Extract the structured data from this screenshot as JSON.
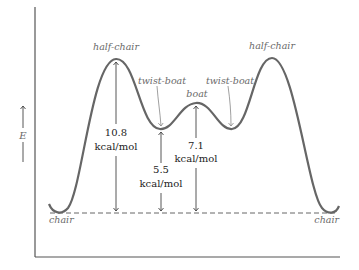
{
  "diagram": {
    "axis": {
      "y_label": "E"
    },
    "labels": {
      "chair_left": "chair",
      "chair_right": "chair",
      "half_chair_left": "half-chair",
      "half_chair_right": "half-chair",
      "twist_boat_left": "twist-boat",
      "twist_boat_right": "twist-boat",
      "boat": "boat"
    },
    "energies": [
      {
        "id": "half_chair",
        "value": "10.8",
        "unit": "kcal/mol"
      },
      {
        "id": "twist_boat",
        "value": "5.5",
        "unit": "kcal/mol"
      },
      {
        "id": "boat",
        "value": "7.1",
        "unit": "kcal/mol"
      }
    ],
    "colors": {
      "curve": "#666666",
      "axis": "#555555",
      "text": "#222222",
      "italic_label": "#6a6a6a"
    }
  }
}
